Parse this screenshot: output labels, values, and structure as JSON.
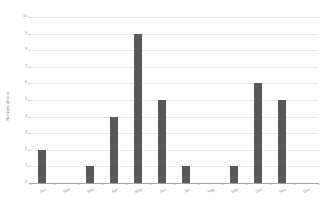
{
  "chart_data": {
    "type": "bar",
    "title": "",
    "xlabel": "",
    "ylabel": "Numbers of birds",
    "categories": [
      "Jan",
      "Feb",
      "Mar",
      "Apr",
      "May",
      "Jun",
      "Jul",
      "Aug",
      "Sep",
      "Oct",
      "Nov",
      "Dec"
    ],
    "values": [
      2,
      0,
      1,
      4,
      9,
      5,
      1,
      0,
      1,
      6,
      5,
      0
    ],
    "ylim": [
      0,
      10
    ],
    "ytick_labels": [
      "0",
      "1",
      "2",
      "3",
      "4",
      "5",
      "6",
      "7",
      "8",
      "9",
      "10"
    ],
    "ytick_values": [
      0,
      1,
      2,
      3,
      4,
      5,
      6,
      7,
      8,
      9,
      10
    ],
    "grid": true,
    "legend": "none",
    "bar_color": "#595959",
    "gridline_color": "#e8e8e8",
    "axis_color": "#a6a6a6",
    "background_color": "#ffffff"
  }
}
